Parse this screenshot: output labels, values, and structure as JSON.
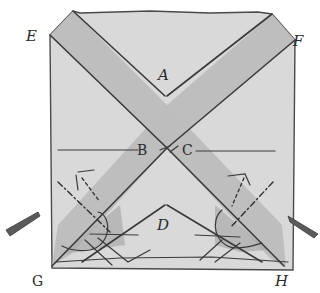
{
  "diagram": {
    "title": "",
    "colors": {
      "paper": "#d9d9d9",
      "band": "#bdbdbd",
      "shade": "#a9a9a9",
      "ink": "#3a3a3a",
      "background": "#ffffff"
    },
    "labels": {
      "A": "A",
      "B": "B",
      "C": "C",
      "D": "D",
      "E": "E",
      "F": "F",
      "G": "G",
      "H": "H"
    },
    "arrows": [
      {
        "name": "left-push-arrow",
        "direction": "right"
      },
      {
        "name": "right-push-arrow",
        "direction": "left"
      }
    ]
  }
}
